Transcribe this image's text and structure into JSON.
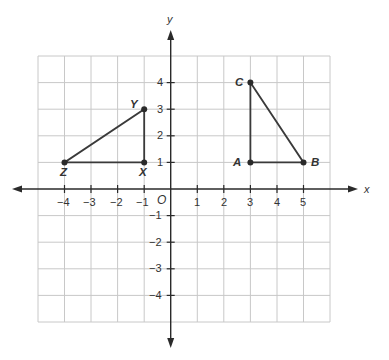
{
  "diagram": {
    "type": "coordinate-plane",
    "axes": {
      "x_label": "x",
      "y_label": "y",
      "origin_label": "O",
      "x_ticks": [
        "−4",
        "−3",
        "−2",
        "−1",
        "1",
        "2",
        "3",
        "4",
        "5"
      ],
      "y_ticks": [
        "4",
        "3",
        "2",
        "1",
        "−1",
        "−2",
        "−3",
        "−4"
      ],
      "x_range": [
        -5,
        6
      ],
      "y_range": [
        -5,
        5
      ]
    },
    "triangles": [
      {
        "name": "XYZ",
        "vertices": [
          {
            "label": "X",
            "x": -1,
            "y": 1
          },
          {
            "label": "Y",
            "x": -1,
            "y": 3
          },
          {
            "label": "Z",
            "x": -4,
            "y": 1
          }
        ]
      },
      {
        "name": "ABC",
        "vertices": [
          {
            "label": "A",
            "x": 3,
            "y": 1
          },
          {
            "label": "B",
            "x": 5,
            "y": 1
          },
          {
            "label": "C",
            "x": 3,
            "y": 4
          }
        ]
      }
    ],
    "colors": {
      "grid": "#c8c8c8",
      "axis": "#2a2a2a",
      "segment": "#3a3a3a"
    }
  }
}
